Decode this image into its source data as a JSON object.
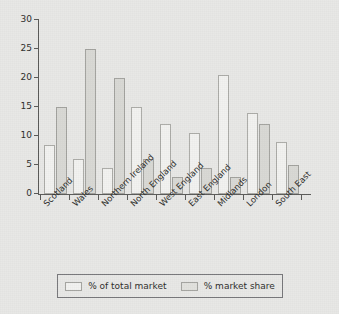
{
  "chart_data": {
    "type": "bar",
    "title": "",
    "subtitle": "",
    "xlabel": "",
    "ylabel": "",
    "ylim": [
      0,
      30
    ],
    "yticks": [
      0,
      5,
      10,
      15,
      20,
      25,
      30
    ],
    "ytick_labels": [
      "0",
      "5",
      "10",
      "15",
      "20",
      "25",
      "30"
    ],
    "grid": false,
    "legend_position": "bottom",
    "categories": [
      "Scotland",
      "Wales",
      "Northern Ireland",
      "North England",
      "West England",
      "East England",
      "Midlands",
      "London",
      "South East"
    ],
    "series": [
      {
        "name": "% of total market",
        "color": "#f2f2f0",
        "values": [
          8.5,
          6,
          4.5,
          15,
          12,
          10.5,
          20.5,
          14,
          9
        ]
      },
      {
        "name": "% market share",
        "color": "#d9d9d5",
        "values": [
          15,
          25,
          20,
          6,
          3,
          4.5,
          3,
          12,
          5
        ]
      }
    ]
  },
  "legend": {
    "items": [
      {
        "label": "% of total market",
        "swatch": "legend-swatch-series-0"
      },
      {
        "label": "% market share",
        "swatch": "legend-swatch-series-1"
      }
    ]
  },
  "colors": {
    "background": "#e8e8e6",
    "axis": "#5a5a58",
    "text": "#2d2d2b",
    "series_0_fill": "#f2f2f0",
    "series_0_edge": "#acaca8",
    "series_1_fill": "#d9d9d5",
    "series_1_edge": "#a3a39f",
    "legend_border": "#77777a"
  }
}
